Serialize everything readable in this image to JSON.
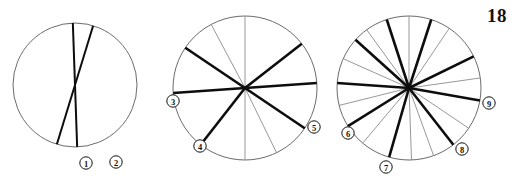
{
  "page": {
    "number": "18"
  },
  "figure": {
    "title": "",
    "background_color": "#ffffff",
    "width": 515,
    "height": 181,
    "outline_color": "#6b6b6b",
    "thick_stroke_color": "#0d0d0d",
    "thin_stroke_color": "#8c8c8c"
  },
  "chart_data": {
    "type": "diagram",
    "title": "",
    "subtitle": "",
    "xlabel": "",
    "ylabel": "",
    "panels": [
      {
        "id": "panel-1",
        "center": [
          75,
          85
        ],
        "radius": 62,
        "outline": true,
        "kind": "chords",
        "segment_count": 2,
        "thick_count": 2,
        "thin_count": 0,
        "lines": [
          {
            "angle_deg": 92,
            "weight": "thick",
            "label": "1"
          },
          {
            "angle_deg": 73,
            "weight": "thick",
            "label": "2"
          }
        ],
        "labels": [
          {
            "text": "1",
            "x": 86,
            "y": 163
          },
          {
            "text": "2",
            "x": 116,
            "y": 162
          }
        ]
      },
      {
        "id": "panel-2",
        "center": [
          245,
          88
        ],
        "radius": 72,
        "outline": true,
        "kind": "radii",
        "segment_count": 10,
        "thick_count": 6,
        "thin_count": 4,
        "spokes": [
          {
            "angle_deg": 90,
            "weight": "thin"
          },
          {
            "angle_deg": 118,
            "weight": "thin"
          },
          {
            "angle_deg": 146,
            "weight": "thick"
          },
          {
            "angle_deg": 184,
            "weight": "thick",
            "label": "3"
          },
          {
            "angle_deg": 232,
            "weight": "thick",
            "label": "4"
          },
          {
            "angle_deg": 270,
            "weight": "thin"
          },
          {
            "angle_deg": 296,
            "weight": "thin"
          },
          {
            "angle_deg": 326,
            "weight": "thick",
            "label": "5"
          },
          {
            "angle_deg": 4,
            "weight": "thick"
          },
          {
            "angle_deg": 38,
            "weight": "thick"
          }
        ],
        "labels": [
          {
            "text": "3",
            "x": 173,
            "y": 101
          },
          {
            "text": "4",
            "x": 200,
            "y": 146
          },
          {
            "text": "5",
            "x": 314,
            "y": 127
          }
        ]
      },
      {
        "id": "panel-3",
        "center": [
          409,
          88
        ],
        "radius": 72,
        "outline": true,
        "kind": "radii",
        "segment_count": 18,
        "thick_count": 9,
        "thin_count": 9,
        "spokes": [
          {
            "angle_deg": 90,
            "weight": "thin"
          },
          {
            "angle_deg": 108,
            "weight": "thick"
          },
          {
            "angle_deg": 126,
            "weight": "thin"
          },
          {
            "angle_deg": 138,
            "weight": "thick"
          },
          {
            "angle_deg": 156,
            "weight": "thin"
          },
          {
            "angle_deg": 176,
            "weight": "thick"
          },
          {
            "angle_deg": 194,
            "weight": "thin"
          },
          {
            "angle_deg": 212,
            "weight": "thick",
            "label": "6"
          },
          {
            "angle_deg": 230,
            "weight": "thin"
          },
          {
            "angle_deg": 254,
            "weight": "thick",
            "label": "7"
          },
          {
            "angle_deg": 272,
            "weight": "thin"
          },
          {
            "angle_deg": 290,
            "weight": "thin"
          },
          {
            "angle_deg": 308,
            "weight": "thick",
            "label": "8"
          },
          {
            "angle_deg": 326,
            "weight": "thin"
          },
          {
            "angle_deg": 350,
            "weight": "thick",
            "label": "9"
          },
          {
            "angle_deg": 8,
            "weight": "thin"
          },
          {
            "angle_deg": 26,
            "weight": "thick"
          },
          {
            "angle_deg": 56,
            "weight": "thin"
          },
          {
            "angle_deg": 72,
            "weight": "thick"
          }
        ],
        "labels": [
          {
            "text": "6",
            "x": 348,
            "y": 133
          },
          {
            "text": "7",
            "x": 386,
            "y": 167
          },
          {
            "text": "8",
            "x": 462,
            "y": 149
          },
          {
            "text": "9",
            "x": 489,
            "y": 103
          }
        ]
      }
    ]
  }
}
